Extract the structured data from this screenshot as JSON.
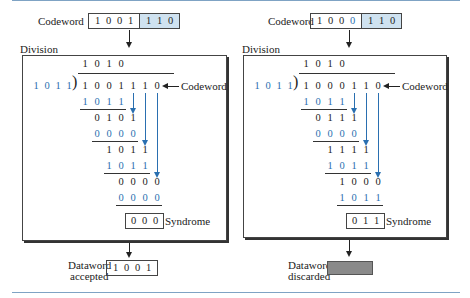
{
  "colors": {
    "accent_blue": "#2a6fb0",
    "highlight_fill": "#cfe2f0",
    "rule": "#7fa3c4",
    "discard_fill": "#8a8a8a"
  },
  "left": {
    "codeword_label": "Codeword",
    "codeword_data_bits": [
      "1",
      "0",
      "0",
      "1"
    ],
    "codeword_check_bits": [
      "1",
      "1",
      "0"
    ],
    "division_label": "Division",
    "quotient": [
      "1",
      "0",
      "1",
      "0"
    ],
    "divisor": [
      "1",
      "0",
      "1",
      "1"
    ],
    "dividend": [
      "1",
      "0",
      "0",
      "1",
      "1",
      "1",
      "0"
    ],
    "dividend_label": "Codeword",
    "steps": [
      {
        "bits": [
          "1",
          "0",
          "1",
          "1"
        ],
        "start_col": 0,
        "color": "blue",
        "underline": true
      },
      {
        "bits": [
          "0",
          "1",
          "0",
          "1"
        ],
        "start_col": 1,
        "color": "black"
      },
      {
        "bits": [
          "0",
          "0",
          "0",
          "0"
        ],
        "start_col": 1,
        "color": "blue",
        "underline": true
      },
      {
        "bits": [
          "1",
          "0",
          "1",
          "1"
        ],
        "start_col": 2,
        "color": "black"
      },
      {
        "bits": [
          "1",
          "0",
          "1",
          "1"
        ],
        "start_col": 2,
        "color": "blue",
        "underline": true
      },
      {
        "bits": [
          "0",
          "0",
          "0",
          "0"
        ],
        "start_col": 3,
        "color": "black"
      },
      {
        "bits": [
          "0",
          "0",
          "0",
          "0"
        ],
        "start_col": 3,
        "color": "blue",
        "underline": true
      }
    ],
    "syndrome": [
      "0",
      "0",
      "0"
    ],
    "syndrome_label": "Syndrome",
    "result_label_1": "Dataword",
    "result_label_2": "accepted",
    "result_bits": [
      "1",
      "0",
      "0",
      "1"
    ]
  },
  "right": {
    "codeword_label": "Codeword",
    "codeword_data_bits": [
      "1",
      "0",
      "0",
      "0"
    ],
    "codeword_error_bit_index": 3,
    "codeword_check_bits": [
      "1",
      "1",
      "0"
    ],
    "division_label": "Division",
    "quotient": [
      "1",
      "0",
      "1",
      "0"
    ],
    "divisor": [
      "1",
      "0",
      "1",
      "1"
    ],
    "dividend": [
      "1",
      "0",
      "0",
      "0",
      "1",
      "1",
      "0"
    ],
    "dividend_label": "Codeword",
    "steps": [
      {
        "bits": [
          "1",
          "0",
          "1",
          "1"
        ],
        "start_col": 0,
        "color": "blue",
        "underline": true
      },
      {
        "bits": [
          "0",
          "1",
          "1",
          "1"
        ],
        "start_col": 1,
        "color": "black"
      },
      {
        "bits": [
          "0",
          "0",
          "0",
          "0"
        ],
        "start_col": 1,
        "color": "blue",
        "underline": true
      },
      {
        "bits": [
          "1",
          "1",
          "1",
          "1"
        ],
        "start_col": 2,
        "color": "black"
      },
      {
        "bits": [
          "1",
          "0",
          "1",
          "1"
        ],
        "start_col": 2,
        "color": "blue",
        "underline": true
      },
      {
        "bits": [
          "1",
          "0",
          "0",
          "0"
        ],
        "start_col": 3,
        "color": "black"
      },
      {
        "bits": [
          "1",
          "0",
          "1",
          "1"
        ],
        "start_col": 3,
        "color": "blue",
        "underline": true
      }
    ],
    "syndrome": [
      "0",
      "1",
      "1"
    ],
    "syndrome_label": "Syndrome",
    "result_label_1": "Dataword",
    "result_label_2": "discarded"
  }
}
